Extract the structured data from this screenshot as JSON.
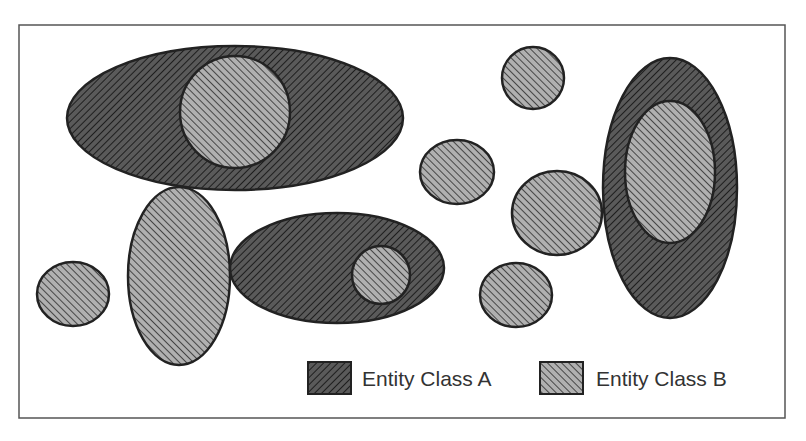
{
  "diagram": {
    "frame": {
      "x": 19,
      "y": 25,
      "width": 766,
      "height": 393,
      "stroke": "#555555"
    },
    "colors": {
      "class_a_fill": "#5a5a5a",
      "class_a_hatch": "#1e1e1e",
      "class_b_fill": "#a8a8a8",
      "class_b_hatch": "#3a3a3a",
      "outline": "#222222"
    },
    "shapes": [
      {
        "id": "a-top-large",
        "class": "A",
        "cx": 235,
        "cy": 118,
        "rx": 168,
        "ry": 72
      },
      {
        "id": "b-in-top",
        "class": "B",
        "cx": 235,
        "cy": 112,
        "rx": 55,
        "ry": 56
      },
      {
        "id": "b-vertical-left",
        "class": "B",
        "cx": 179,
        "cy": 276,
        "rx": 51,
        "ry": 89
      },
      {
        "id": "b-small-left",
        "class": "B",
        "cx": 73,
        "cy": 294,
        "rx": 36,
        "ry": 32
      },
      {
        "id": "a-middle",
        "class": "A",
        "cx": 337,
        "cy": 268,
        "rx": 107,
        "ry": 55
      },
      {
        "id": "b-in-middle",
        "class": "B",
        "cx": 381,
        "cy": 275,
        "rx": 29,
        "ry": 29
      },
      {
        "id": "b-top-right-small",
        "class": "B",
        "cx": 533,
        "cy": 78,
        "rx": 31,
        "ry": 31
      },
      {
        "id": "b-center",
        "class": "B",
        "cx": 457,
        "cy": 172,
        "rx": 37,
        "ry": 32
      },
      {
        "id": "b-center-right",
        "class": "B",
        "cx": 557,
        "cy": 213,
        "rx": 45,
        "ry": 42
      },
      {
        "id": "b-lower-center",
        "class": "B",
        "cx": 516,
        "cy": 295,
        "rx": 36,
        "ry": 32
      },
      {
        "id": "a-right-vertical",
        "class": "A",
        "cx": 670,
        "cy": 188,
        "rx": 67,
        "ry": 130
      },
      {
        "id": "b-in-right",
        "class": "B",
        "cx": 670,
        "cy": 172,
        "rx": 45,
        "ry": 71
      }
    ]
  },
  "legend": {
    "items": [
      {
        "label": "Entity Class A",
        "class": "A",
        "swatch_x": 308,
        "swatch_y": 362,
        "text_x": 362,
        "text_y": 386
      },
      {
        "label": "Entity Class B",
        "class": "B",
        "swatch_x": 540,
        "swatch_y": 362,
        "text_x": 596,
        "text_y": 386
      }
    ]
  }
}
